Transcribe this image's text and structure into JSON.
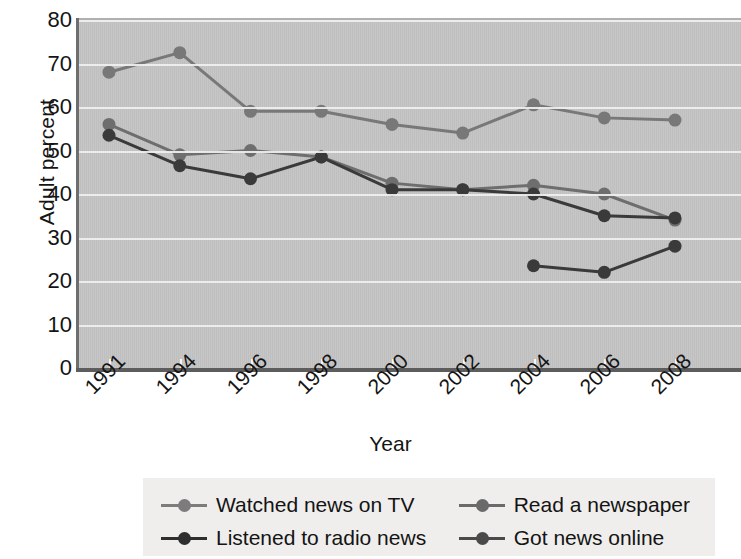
{
  "chart_data": {
    "type": "line",
    "title": "",
    "xlabel": "Year",
    "ylabel": "Adult percent",
    "categories": [
      "1991",
      "1994",
      "1996",
      "1998",
      "2000",
      "2002",
      "2004",
      "2006",
      "2008"
    ],
    "ylim": [
      0,
      80
    ],
    "yticks": [
      0,
      10,
      20,
      30,
      40,
      50,
      60,
      70,
      80
    ],
    "grid": "horizontal",
    "legend_position": "bottom",
    "series": [
      {
        "name": "Watched news on TV",
        "color": "#787878",
        "x": [
          "1991",
          "1994",
          "1996",
          "1998",
          "2000",
          "2002",
          "2004",
          "2006",
          "2008"
        ],
        "values": [
          68,
          72.5,
          59,
          59,
          56,
          54,
          60.5,
          57.5,
          57
        ]
      },
      {
        "name": "Read a newspaper",
        "color": "#6e6e6e",
        "x": [
          "1991",
          "1994",
          "1996",
          "1998",
          "2000",
          "2002",
          "2004",
          "2006",
          "2008"
        ],
        "values": [
          56,
          49,
          50,
          48.5,
          42.5,
          41,
          42,
          40,
          34
        ]
      },
      {
        "name": "Listened to radio news",
        "color": "#3a3a3a",
        "x": [
          "1991",
          "1994",
          "1996",
          "1998",
          "2000",
          "2002",
          "2004",
          "2006",
          "2008"
        ],
        "values": [
          53.5,
          46.5,
          43.5,
          48.5,
          41,
          41,
          40,
          35,
          34.5
        ]
      },
      {
        "name": "Got news online",
        "color": "#3a3a3a",
        "x": [
          "2004",
          "2006",
          "2008"
        ],
        "values": [
          23.5,
          22,
          28
        ]
      }
    ]
  },
  "legend": {
    "rows": [
      [
        {
          "label": "Watched news on TV",
          "color": "#7c7c7c"
        },
        {
          "label": "Read a newspaper",
          "color": "#6a6a6a"
        }
      ],
      [
        {
          "label": "Listened to radio news",
          "color": "#2e2e2e"
        },
        {
          "label": "Got news online",
          "color": "#4a4a4a"
        }
      ]
    ]
  }
}
